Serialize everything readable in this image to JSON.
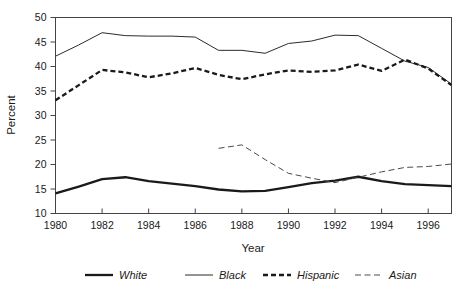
{
  "chart_data": {
    "type": "line",
    "title": "",
    "xlabel": "Year",
    "ylabel": "Percent",
    "xlim": [
      1980,
      1997
    ],
    "ylim": [
      10,
      50
    ],
    "grid": false,
    "legend_position": "bottom",
    "xticks": [
      1980,
      1982,
      1984,
      1986,
      1988,
      1990,
      1992,
      1994,
      1996
    ],
    "xtick_labels": [
      "1980",
      "1982",
      "1984",
      "1986",
      "1988",
      "1990",
      "1992",
      "1994",
      "1996"
    ],
    "yticks": [
      10,
      15,
      20,
      25,
      30,
      35,
      40,
      45,
      50
    ],
    "ytick_labels": [
      "10",
      "15",
      "20",
      "25",
      "30",
      "35",
      "40",
      "45",
      "50"
    ],
    "x": [
      1980,
      1981,
      1982,
      1983,
      1984,
      1985,
      1986,
      1987,
      1988,
      1989,
      1990,
      1991,
      1992,
      1993,
      1994,
      1995,
      1996,
      1997
    ],
    "series": [
      {
        "name": "White",
        "style": "solid",
        "width": 2.3,
        "color": "#1a1a1a",
        "x": [
          1980,
          1981,
          1982,
          1983,
          1984,
          1985,
          1986,
          1987,
          1988,
          1989,
          1990,
          1991,
          1992,
          1993,
          1994,
          1995,
          1996,
          1997
        ],
        "values": [
          14.1,
          15.5,
          17.0,
          17.4,
          16.6,
          16.1,
          15.6,
          14.9,
          14.5,
          14.6,
          15.4,
          16.2,
          16.7,
          17.5,
          16.6,
          16.0,
          15.8,
          15.6
        ]
      },
      {
        "name": "Black",
        "style": "solid",
        "width": 1.0,
        "color": "#2b2b2b",
        "x": [
          1980,
          1981,
          1982,
          1983,
          1984,
          1985,
          1986,
          1987,
          1988,
          1989,
          1990,
          1991,
          1992,
          1993,
          1994,
          1995,
          1996,
          1997
        ],
        "values": [
          42.1,
          44.4,
          46.9,
          46.3,
          46.2,
          46.2,
          46.0,
          43.3,
          43.3,
          42.7,
          44.7,
          45.2,
          46.4,
          46.3,
          43.7,
          41.1,
          39.8,
          36.4
        ]
      },
      {
        "name": "Hispanic",
        "style": "dashed",
        "width": 2.3,
        "color": "#1a1a1a",
        "x": [
          1980,
          1981,
          1982,
          1983,
          1984,
          1985,
          1986,
          1987,
          1988,
          1989,
          1990,
          1991,
          1992,
          1993,
          1994,
          1995,
          1996,
          1997
        ],
        "values": [
          33.1,
          36.2,
          39.3,
          38.8,
          37.8,
          38.6,
          39.7,
          38.3,
          37.4,
          38.4,
          39.2,
          38.9,
          39.2,
          40.4,
          39.1,
          41.4,
          39.6,
          36.2
        ]
      },
      {
        "name": "Asian",
        "style": "dashed",
        "width": 1.0,
        "color": "#4a4a4a",
        "x": [
          1987,
          1988,
          1989,
          1990,
          1991,
          1992,
          1993,
          1994,
          1995,
          1996,
          1997
        ],
        "values": [
          23.3,
          24.0,
          21.0,
          18.2,
          17.2,
          16.3,
          17.4,
          18.5,
          19.4,
          19.6,
          20.1
        ]
      }
    ],
    "legend": [
      {
        "label": "White",
        "style": "solid",
        "width": 2.3,
        "color": "#1a1a1a"
      },
      {
        "label": "Black",
        "style": "solid",
        "width": 1.0,
        "color": "#2b2b2b"
      },
      {
        "label": "Hispanic",
        "style": "dashed",
        "width": 2.3,
        "color": "#1a1a1a"
      },
      {
        "label": "Asian",
        "style": "dashed",
        "width": 1.0,
        "color": "#4a4a4a"
      }
    ]
  }
}
